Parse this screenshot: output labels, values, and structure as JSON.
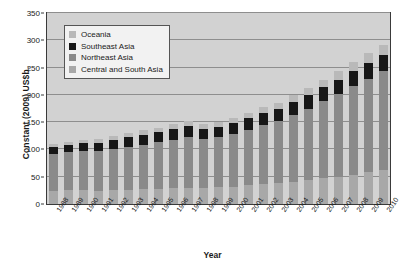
{
  "chart_data": {
    "type": "bar",
    "stacked": true,
    "title": "",
    "xlabel": "Year",
    "ylabel": "Constant (2009) US$b.",
    "ylim": [
      0,
      350
    ],
    "yticks": [
      0,
      50,
      100,
      150,
      200,
      250,
      300,
      350
    ],
    "grid": true,
    "legend_position": "top-left",
    "categories": [
      "1988",
      "1989",
      "1990",
      "1991",
      "1992",
      "1993",
      "1994",
      "1995",
      "1996",
      "1997",
      "1998",
      "1999",
      "2000",
      "2001",
      "2002",
      "2003",
      "2004",
      "2005",
      "2006",
      "2007",
      "2008",
      "2009",
      "2010"
    ],
    "series": [
      {
        "name": "Central and South Asia",
        "color": "#a8a8a8",
        "values": [
          24,
          25,
          25,
          24,
          25,
          26,
          27,
          28,
          29,
          30,
          30,
          31,
          32,
          34,
          36,
          38,
          41,
          44,
          47,
          50,
          54,
          58,
          62
        ]
      },
      {
        "name": "Northeast Asia",
        "color": "#8a8a8a",
        "values": [
          68,
          70,
          72,
          73,
          76,
          79,
          82,
          85,
          88,
          92,
          90,
          92,
          96,
          102,
          108,
          114,
          122,
          131,
          141,
          151,
          162,
          172,
          181
        ]
      },
      {
        "name": "Southeast Asia",
        "color": "#171717",
        "values": [
          12,
          13,
          14,
          15,
          16,
          17,
          18,
          19,
          20,
          21,
          18,
          19,
          20,
          21,
          22,
          23,
          24,
          25,
          26,
          27,
          28,
          29,
          30
        ]
      },
      {
        "name": "Oceania",
        "color": "#b9b9b9",
        "values": [
          6,
          6,
          7,
          7,
          7,
          8,
          8,
          8,
          9,
          9,
          9,
          9,
          10,
          10,
          11,
          11,
          12,
          13,
          14,
          15,
          16,
          17,
          18
        ]
      }
    ],
    "totals": [
      110,
      114,
      118,
      119,
      124,
      130,
      135,
      140,
      146,
      152,
      147,
      151,
      158,
      167,
      177,
      186,
      199,
      213,
      228,
      243,
      260,
      276,
      291
    ]
  },
  "legend": {
    "items": [
      {
        "label": "Oceania",
        "color": "#b9b9b9"
      },
      {
        "label": "Southeast Asia",
        "color": "#171717"
      },
      {
        "label": "Northeast Asia",
        "color": "#8a8a8a"
      },
      {
        "label": "Central and South Asia",
        "color": "#a8a8a8"
      }
    ]
  }
}
